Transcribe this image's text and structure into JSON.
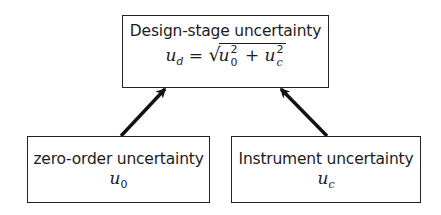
{
  "diagram": {
    "top_box": {
      "title": "Design-stage uncertainty",
      "formula": {
        "lhs_symbol": "u",
        "lhs_subscript": "d",
        "equals": "=",
        "radical": "√",
        "term1_symbol": "u",
        "term1_superscript": "2",
        "term1_subscript": "0",
        "plus": "+",
        "term2_symbol": "u",
        "term2_superscript": "2",
        "term2_subscript": "c"
      }
    },
    "left_box": {
      "title": "zero-order uncertainty",
      "symbol": "u",
      "subscript": "0"
    },
    "right_box": {
      "title": "Instrument uncertainty",
      "symbol": "u",
      "subscript": "c"
    },
    "arrows": [
      {
        "from": "left_box",
        "to": "top_box"
      },
      {
        "from": "right_box",
        "to": "top_box"
      }
    ],
    "colors": {
      "line": "#222222",
      "background": "#ffffff"
    }
  }
}
